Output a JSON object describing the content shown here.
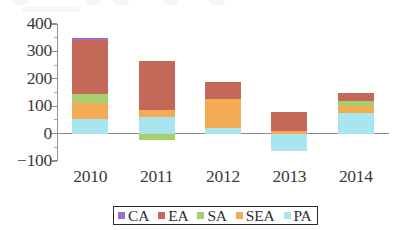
{
  "chart_data": {
    "type": "bar",
    "stacked": true,
    "title": "",
    "subtitle": "",
    "xlabel": "",
    "ylabel": "",
    "categories": [
      "2010",
      "2011",
      "2012",
      "2013",
      "2014"
    ],
    "ytick_labels": [
      "400",
      "300",
      "200",
      "100",
      "0",
      "-100"
    ],
    "ytick_values": [
      400,
      300,
      200,
      100,
      0,
      -100
    ],
    "ylim": [
      -100,
      400
    ],
    "minor_tick_interval": 50,
    "grid": false,
    "legend_position": "bottom",
    "series": [
      {
        "name": "CA",
        "color": "#9b6fc9",
        "values": [
          8,
          0,
          0,
          0,
          0
        ]
      },
      {
        "name": "EA",
        "color": "#c4695a",
        "values": [
          195,
          180,
          65,
          70,
          30
        ]
      },
      {
        "name": "SA",
        "color": "#a8cf6e",
        "values": [
          35,
          -22,
          0,
          0,
          20
        ]
      },
      {
        "name": "SEA",
        "color": "#f4ab55",
        "values": [
          55,
          25,
          105,
          10,
          25
        ]
      },
      {
        "name": "PA",
        "color": "#a9e5ef",
        "values": [
          55,
          60,
          20,
          -65,
          75
        ]
      }
    ],
    "totals_positive": [
      348,
      265,
      190,
      80,
      150
    ],
    "totals_negative": [
      0,
      -22,
      0,
      -65,
      0
    ]
  },
  "legend": {
    "items": [
      {
        "label": "CA",
        "color": "#9b6fc9"
      },
      {
        "label": "EA",
        "color": "#c4695a"
      },
      {
        "label": "SA",
        "color": "#a8cf6e"
      },
      {
        "label": "SEA",
        "color": "#f4ab55"
      },
      {
        "label": "PA",
        "color": "#a9e5ef"
      }
    ]
  },
  "axes": {
    "axis_color": "#8f8f8f",
    "zero_line_color": "#8a8a8a",
    "tick_label_color": "#3a3a3a"
  }
}
